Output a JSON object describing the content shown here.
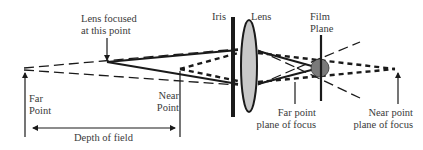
{
  "diagram": {
    "colors": {
      "line": "#1a1a1a",
      "lens_fill": "#c8c8c8",
      "sensor_circle": "#7a7a7a",
      "text": "#3a3a3a",
      "background": "#ffffff"
    },
    "labels": {
      "lens_focused": {
        "line1": "Lens focused",
        "line2": "at this point"
      },
      "iris": "Iris",
      "lens": "Lens",
      "film_plane": {
        "line1": "Film",
        "line2": "Plane"
      },
      "far_point": {
        "line1": "Far",
        "line2": "Point"
      },
      "near_point": {
        "line1": "Near",
        "line2": "Point"
      },
      "depth_of_field": "Depth of field",
      "far_point_plane": {
        "line1": "Far point",
        "line2": "plane of focus"
      },
      "near_point_plane": {
        "line1": "Near point",
        "line2": "plane of focus"
      }
    },
    "components": [
      "far-point",
      "focus-point",
      "near-point",
      "iris",
      "lens",
      "film-plane",
      "far-point-plane-of-focus",
      "near-point-plane-of-focus"
    ]
  }
}
